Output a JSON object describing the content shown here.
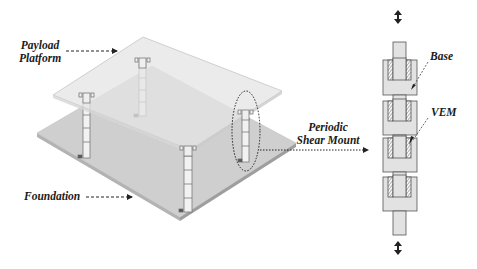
{
  "figure": {
    "labels": {
      "payload_platform_line1": "Payload",
      "payload_platform_line2": "Platform",
      "foundation": "Foundation",
      "periodic_shear_mount_line1": "Periodic",
      "periodic_shear_mount_line2": "Shear Mount",
      "base": "Base",
      "vem": "VEM"
    },
    "components": [
      "payload-platform",
      "foundation-plate",
      "shear-mount-columns",
      "periodic-shear-mount-detail"
    ],
    "mount_columns_count": 4,
    "detail_unit_cells": 4,
    "colors": {
      "platform_fill": "#e6e6e6",
      "foundation_fill": "#c9c9c9",
      "detail_fill": "#e2e2e2",
      "outline": "#555555",
      "text": "#1a1a1a"
    }
  }
}
